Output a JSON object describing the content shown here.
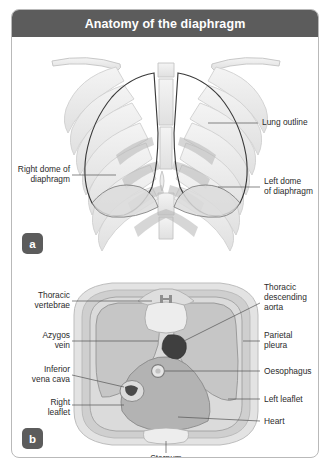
{
  "figure": {
    "title": "Anatomy of the diaphragm",
    "panels": [
      {
        "badge": "a",
        "view": "anterior thoracic cage with lungs and diaphragm domes",
        "labels": [
          {
            "name": "lung-outline",
            "text": "Lung outline"
          },
          {
            "name": "right-dome",
            "text": "Right dome of\ndiaphragm"
          },
          {
            "name": "left-dome",
            "text": "Left dome\nof diaphragm"
          }
        ]
      },
      {
        "badge": "b",
        "view": "axial cross-section at the level of the diaphragm",
        "labels": [
          {
            "name": "thoracic-vertebrae",
            "text": "Thoracic\nvertebrae"
          },
          {
            "name": "azygos-vein",
            "text": "Azygos\nvein"
          },
          {
            "name": "inferior-vena-cava",
            "text": "Inferior\nvena cava"
          },
          {
            "name": "right-leaflet",
            "text": "Right\nleaflet"
          },
          {
            "name": "thoracic-descending-aorta",
            "text": "Thoracic\ndescending\naorta"
          },
          {
            "name": "parietal-pleura",
            "text": "Parietal\npleura"
          },
          {
            "name": "oesophagus",
            "text": "Oesophagus"
          },
          {
            "name": "left-leaflet",
            "text": "Left leaflet"
          },
          {
            "name": "heart",
            "text": "Heart"
          },
          {
            "name": "sternum",
            "text": "Sternum"
          }
        ]
      }
    ],
    "colors": {
      "title_bar": "#5c5c5c",
      "frame_border": "#b9b9b9",
      "page": "#ffffff",
      "bone": "#e8e8e8",
      "soft_tissue": "#c9c9c9",
      "muscle": "#b0b0b0",
      "vessel_dark": "#4a4a4a",
      "leader_line": "#555555"
    }
  }
}
